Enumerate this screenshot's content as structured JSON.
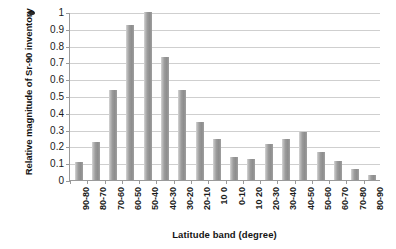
{
  "chart_data": {
    "type": "bar",
    "title": "",
    "subtitle": "",
    "xlabel": "Latitude band (degree)",
    "ylabel": "Relative magnitude of Sr-90 inventory",
    "categories": [
      "90-80",
      "80-70",
      "70-60",
      "60-50",
      "50-40",
      "40-30",
      "30-20",
      "20-10",
      "10 0",
      "0-10",
      "10 20",
      "20-30",
      "30-40",
      "40-50",
      "50-60",
      "60-70",
      "70-80",
      "80-90"
    ],
    "values": [
      0.105,
      0.225,
      0.535,
      0.925,
      1.0,
      0.735,
      0.535,
      0.345,
      0.245,
      0.135,
      0.125,
      0.215,
      0.245,
      0.285,
      0.165,
      0.115,
      0.065,
      0.03
    ],
    "ylim": [
      0,
      1
    ],
    "yticks": [
      "0",
      "0.1",
      "0.2",
      "0.3",
      "0.4",
      "0.5",
      "0.6",
      "0.7",
      "0.8",
      "0.9",
      "1"
    ],
    "ytick_values": [
      0,
      0.1,
      0.2,
      0.3,
      0.4,
      0.5,
      0.6,
      0.7,
      0.8,
      0.9,
      1
    ],
    "grid": true,
    "grid_axis": "y",
    "legend": false,
    "legend_position": "none",
    "series": [
      {
        "name": "Relative magnitude of Sr-90 inventory",
        "values": [
          0.105,
          0.225,
          0.535,
          0.925,
          1.0,
          0.735,
          0.535,
          0.345,
          0.245,
          0.135,
          0.125,
          0.215,
          0.245,
          0.285,
          0.165,
          0.115,
          0.065,
          0.03
        ]
      }
    ],
    "colors": {
      "bar_fill": "#9b9b9b",
      "bar_fill_light": "#d7d7d7",
      "gridline": "#cfcfcf",
      "axis": "#9a9a9a",
      "text": "#1a1a1a",
      "background": "#ffffff"
    }
  }
}
